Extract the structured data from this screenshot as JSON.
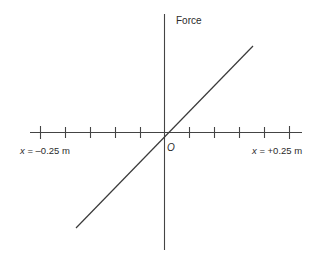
{
  "figure": {
    "axis_title_y": "Force",
    "origin_label": "O",
    "label_left": "x = –0.25 m",
    "label_right": "x = +0.25 m",
    "line_color": "#444444",
    "text_color": "#2b2b2b",
    "background_color": "#ffffff"
  },
  "chart_data": {
    "type": "line",
    "title": "",
    "xlabel": "",
    "ylabel": "Force",
    "x": [
      -0.25,
      0,
      0.25
    ],
    "values": [
      -1,
      0,
      1
    ],
    "series": [
      {
        "name": "Force",
        "x": [
          -0.22,
          0,
          0.25
        ],
        "values": [
          -0.81,
          0,
          0.95
        ]
      }
    ],
    "xlim": [
      -0.27,
      0.275
    ],
    "ylim": [
      -1.05,
      1.05
    ],
    "xtick_labels": [
      "x = –0.25 m",
      "x = +0.25 m"
    ],
    "xtick_values": [
      -0.25,
      -0.2,
      -0.15,
      -0.1,
      -0.05,
      0.05,
      0.1,
      0.15,
      0.2,
      0.25
    ],
    "ytick_values": [],
    "grid": false,
    "legend": "none",
    "annotations": [
      "O"
    ]
  }
}
